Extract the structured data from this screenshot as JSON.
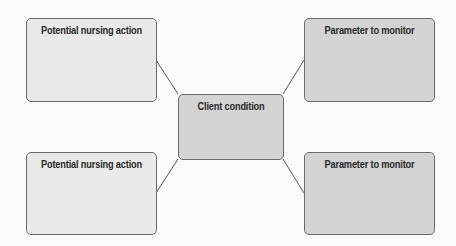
{
  "diagram": {
    "center": {
      "label": "Client condition"
    },
    "nodes": [
      {
        "position": "top-left",
        "label": "Potential nursing action"
      },
      {
        "position": "top-right",
        "label": "Parameter to monitor"
      },
      {
        "position": "bottom-left",
        "label": "Potential nursing action"
      },
      {
        "position": "bottom-right",
        "label": "Parameter to monitor"
      }
    ],
    "colors": {
      "light_box": "#e9e9e9",
      "dark_box": "#d4d4d4",
      "border": "#6a6a6a"
    }
  }
}
